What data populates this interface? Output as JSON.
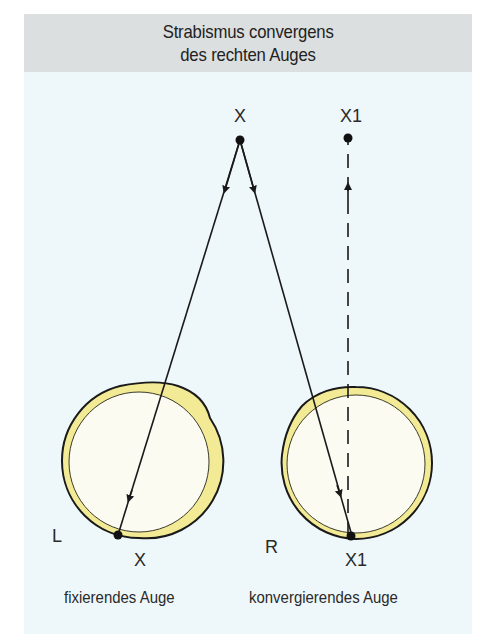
{
  "title": {
    "line1": "Strabismus convergens",
    "line2": "des rechten Auges"
  },
  "colors": {
    "panel_background": "#eef8fa",
    "title_band": "#dcdfe0",
    "eye_rim": "#f3ea96",
    "eye_fill": "#fbfbf2",
    "line": "#1a1a1a"
  },
  "points": {
    "fixation_point": {
      "label": "X",
      "x": 240,
      "y": 140
    },
    "projected_point": {
      "label": "X1",
      "x": 348,
      "y": 140
    }
  },
  "eyes": [
    {
      "side_label": "L",
      "retina_point_label": "X",
      "caption": "fixierendes Auge",
      "center": {
        "x": 139,
        "y": 461
      },
      "radius": 77,
      "retina_point": {
        "x": 118,
        "y": 535
      }
    },
    {
      "side_label": "R",
      "retina_point_label": "X1",
      "caption": "konvergierendes Auge",
      "center": {
        "x": 356,
        "y": 463
      },
      "radius": 76,
      "retina_point": {
        "x": 352,
        "y": 536
      }
    }
  ],
  "rays": [
    {
      "from": "X",
      "to": "left-retina-X",
      "style": "solid",
      "arrow": "down"
    },
    {
      "from": "X",
      "to": "right-retina-X1",
      "style": "solid",
      "arrow": "down"
    },
    {
      "from": "right-retina-X1",
      "to": "X1",
      "style": "dashed",
      "arrow": "up"
    }
  ]
}
